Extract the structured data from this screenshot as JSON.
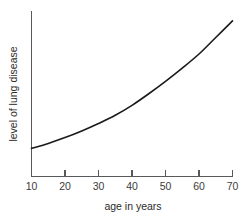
{
  "chart_data": {
    "type": "line",
    "title": "",
    "subtitle": "",
    "xlabel": "age in years",
    "ylabel": "level of lung disease",
    "xlim": [
      10,
      70
    ],
    "ylim": [
      0,
      1
    ],
    "grid": false,
    "legend": null,
    "x_ticks": [
      10,
      20,
      30,
      40,
      50,
      60,
      70
    ],
    "x_tick_labels": [
      "10",
      "20",
      "30",
      "40",
      "50",
      "60",
      "70"
    ],
    "y_ticks": [],
    "y_tick_labels": [],
    "annotations": [],
    "series": [
      {
        "name": "level of lung disease",
        "color": "#1a1a1a",
        "x": [
          10,
          15,
          20,
          25,
          30,
          35,
          40,
          45,
          50,
          55,
          60,
          65,
          70
        ],
        "y": [
          0.17,
          0.2,
          0.235,
          0.275,
          0.32,
          0.37,
          0.43,
          0.5,
          0.575,
          0.655,
          0.74,
          0.84,
          0.94
        ]
      }
    ]
  },
  "axis": {
    "x_title": "age in years",
    "y_title": "level of lung disease"
  },
  "ticks": {
    "x_labels": [
      "10",
      "20",
      "30",
      "40",
      "50",
      "60",
      "70"
    ]
  },
  "colors": {
    "curve": "#1a1a1a",
    "axis": "#58595b",
    "background": "#ffffff",
    "text": "#2b2b2b"
  }
}
